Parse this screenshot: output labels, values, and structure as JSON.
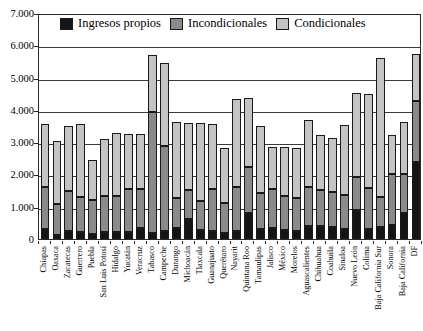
{
  "chart_data": {
    "type": "bar",
    "subtype": "stacked-column",
    "title": "",
    "xlabel": "",
    "ylabel": "",
    "ylim": [
      0,
      7000
    ],
    "ytick_labels": [
      "0",
      "1.000",
      "2.000",
      "3.000",
      "4.000",
      "5.000",
      "6.000",
      "7.000"
    ],
    "ytick_values": [
      0,
      1000,
      2000,
      3000,
      4000,
      5000,
      6000,
      7000
    ],
    "grid": true,
    "legend_position": "top-inside",
    "legend": [
      "Ingresos propios",
      "Incondicionales",
      "Condicionales"
    ],
    "colors": {
      "Ingresos propios": "#151515",
      "Incondicionales": "#8a8a8a",
      "Condicionales": "#c4c4c4",
      "axis": "#2a2a2a",
      "background": "#ffffff"
    },
    "categories": [
      "Chiapas",
      "Oaxaca",
      "Zacatecas",
      "Guerrero",
      "Puebla",
      "San Luis Potosí",
      "Hidalgo",
      "Yucatán",
      "Veracruz",
      "Tabasco",
      "Campeche",
      "Durango",
      "Michoacán",
      "Tlaxcala",
      "Guanajuato",
      "Querétaro",
      "Nayarit",
      "Quintana Roo",
      "Tamaulipas",
      "Jalisco",
      "México",
      "Morelos",
      "Aguascalientes",
      "Chihuahua",
      "Coahuila",
      "Sinaloa",
      "Nuevo León",
      "Colima",
      "Baja California Sur",
      "Sonora",
      "Baja California",
      "DF"
    ],
    "series": [
      {
        "name": "Ingresos propios",
        "values": [
          300,
          110,
          250,
          230,
          170,
          230,
          230,
          230,
          330,
          190,
          240,
          330,
          630,
          280,
          240,
          200,
          240,
          800,
          300,
          350,
          270,
          260,
          400,
          390,
          370,
          300,
          890,
          320,
          360,
          430,
          800,
          2400
        ]
      },
      {
        "name": "Incondicionales",
        "values": [
          1320,
          980,
          1240,
          1070,
          1030,
          1110,
          1100,
          1330,
          1230,
          3740,
          2650,
          940,
          900,
          900,
          1310,
          920,
          1380,
          1430,
          1130,
          1190,
          1070,
          1000,
          1210,
          1120,
          1090,
          1060,
          1020,
          1250,
          950,
          1590,
          1200,
          1860
        ]
      },
      {
        "name": "Condicionales",
        "values": [
          1930,
          1940,
          2000,
          2270,
          1260,
          1760,
          1940,
          1700,
          1690,
          1760,
          2560,
          2350,
          2060,
          2400,
          2010,
          1690,
          2720,
          2130,
          2080,
          1300,
          1500,
          1560,
          2090,
          1720,
          1680,
          2160,
          2600,
          2930,
          4290,
          1200,
          1620,
          1480
        ]
      }
    ],
    "totals": [
      3550,
      3030,
      3490,
      3570,
      2460,
      3100,
      3270,
      3260,
      3250,
      5690,
      5450,
      3620,
      3590,
      3580,
      3560,
      2810,
      4340,
      4360,
      3510,
      2840,
      2840,
      2820,
      3700,
      3230,
      3140,
      3520,
      4510,
      4500,
      5600,
      3220,
      3620,
      5740
    ]
  }
}
